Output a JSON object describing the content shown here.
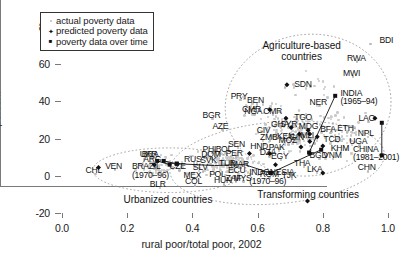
{
  "chart_data": {
    "type": "scatter",
    "title": "",
    "xlabel": "rural poor/total poor, 2002",
    "ylabel": "percent",
    "xlim": [
      0.0,
      1.0
    ],
    "ylim": [
      -20,
      80
    ],
    "xticks": [
      "0.0",
      "0.2",
      "0.4",
      "0.6",
      "0.8",
      "1.0"
    ],
    "yticks": [
      "-20",
      "0",
      "20",
      "40",
      "60",
      "80"
    ],
    "grid": false,
    "legend_position": "top-left",
    "legend": [
      {
        "marker": "dot",
        "label": "actual poverty data"
      },
      {
        "marker": "diamond",
        "label": "predicted poverty data"
      },
      {
        "marker": "square",
        "label": "poverty data over time"
      }
    ],
    "group_annotations": [
      {
        "label": "Agriculture-based",
        "label2": "countries",
        "x": 0.735,
        "y": 70
      },
      {
        "label": "Transforming countries",
        "x": 0.755,
        "y": -10.5
      },
      {
        "label": "Urbanized countries",
        "x": 0.325,
        "y": -13.0
      }
    ],
    "predicted_points": [
      {
        "code": "SDN",
        "x": 0.69,
        "y": 49.0,
        "label_dx": 5,
        "label_dy": -4
      },
      {
        "code": "CMR",
        "x": 0.637,
        "y": 35.5,
        "label_dx": -26,
        "label_dy": -4
      },
      {
        "code": "TGO",
        "x": 0.687,
        "y": 31.0,
        "label_dx": 5,
        "label_dy": -4
      },
      {
        "code": "SYR",
        "x": 0.703,
        "y": 26.0,
        "label_dx": -4,
        "label_dy": -12
      },
      {
        "code": "GIN",
        "x": 0.728,
        "y": 22.5,
        "label_dx": -5,
        "label_dy": -10
      },
      {
        "code": "MDG",
        "x": 0.755,
        "y": 24.5,
        "label_dx": -5,
        "label_dy": -11
      },
      {
        "code": "MLI",
        "x": 0.76,
        "y": 22.5,
        "label_dx": -4,
        "label_dy": -10
      },
      {
        "code": "TCD",
        "x": 0.783,
        "y": 21.0,
        "label_dx": 3,
        "label_dy": -4
      },
      {
        "code": "IRN",
        "x": 0.76,
        "y": 18.5,
        "label_dx": -4,
        "label_dy": -10
      },
      {
        "code": "YEM",
        "x": 0.8,
        "y": 16.0,
        "label_dx": 4,
        "label_dy": -4
      },
      {
        "code": "GTM",
        "x": 0.733,
        "y": 15.5,
        "label_dx": -6,
        "label_dy": -10
      },
      {
        "code": "IND",
        "x": 0.76,
        "y": 12.0,
        "label_dx": -4,
        "label_dy": -9
      },
      {
        "code": "IDN",
        "x": 0.637,
        "y": 12.0,
        "label_dx": -5,
        "label_dy": -9
      },
      {
        "code": "AGO",
        "x": 0.575,
        "y": 12.0,
        "label_dx": -23,
        "label_dy": -3
      },
      {
        "code": "TUN",
        "x": 0.655,
        "y": 6.0,
        "label_dx": -23,
        "label_dy": -3
      },
      {
        "code": "ZAR",
        "x": 0.8,
        "y": 1.5,
        "label_dx": 4,
        "label_dy": -4
      },
      {
        "code": "ZWE",
        "x": 0.753,
        "y": -13.5,
        "label_dx": 4,
        "label_dy": -4
      },
      {
        "code": "BRAZIL",
        "x": 0.283,
        "y": 6.0,
        "label_dx": 0,
        "label_dy": 0
      },
      {
        "code": "PNG",
        "x": 0.96,
        "y": 31.0,
        "label_dx": -22,
        "label_dy": -10
      },
      {
        "code": "CHL",
        "x": 0.112,
        "y": 4.5,
        "label_dx": -20,
        "label_dy": -2
      }
    ],
    "time_series": [
      {
        "name": "INDIA (1965-94)",
        "label": "INDIA",
        "label2": "(1965–94)",
        "points": [
          [
            0.838,
            43.0
          ],
          [
            0.758,
            12.5
          ]
        ]
      },
      {
        "name": "CHINA (1981-2001)",
        "label": "CHINA",
        "label2": "(1981–2001)",
        "points": [
          [
            0.981,
            28.5
          ],
          [
            0.981,
            11.0
          ]
        ]
      },
      {
        "name": "INDONESIA (1970-96)",
        "label": "INDONESIA",
        "label2": "(1970–96)",
        "points": [
          [
            0.795,
            14.0
          ],
          [
            0.64,
            1.5
          ]
        ]
      },
      {
        "name": "BRAZIL (1970-96)",
        "label": "BRAZIL",
        "label2": "(1970–96)",
        "points": [
          [
            0.292,
            8.0
          ],
          [
            0.33,
            6.0
          ]
        ]
      },
      {
        "name": "UKR",
        "label": "UKR",
        "label2": "",
        "points": [
          [
            0.312,
            8.0
          ],
          [
            0.352,
            6.5
          ]
        ]
      },
      {
        "name": "row-transform",
        "label": "",
        "label2": "",
        "points": [
          [
            0.352,
            6.5
          ],
          [
            0.468,
            5.5
          ],
          [
            0.56,
            6.0
          ],
          [
            0.64,
            1.5
          ]
        ]
      }
    ],
    "country_labels": [
      {
        "code": "BDI",
        "x": 0.962,
        "y": 72.5,
        "anchor": "left"
      },
      {
        "code": "RWA",
        "x": 0.905,
        "y": 63.0,
        "anchor": "center"
      },
      {
        "code": "MWI",
        "x": 0.893,
        "y": 55.0,
        "anchor": "center"
      },
      {
        "code": "SDN",
        "x": 0.7,
        "y": 49.0,
        "anchor": "left"
      },
      {
        "code": "CMR",
        "x": 0.62,
        "y": 35.5,
        "anchor": "right"
      },
      {
        "code": "PRY",
        "x": 0.548,
        "y": 42.5,
        "anchor": "center"
      },
      {
        "code": "BEN",
        "x": 0.598,
        "y": 40.0,
        "anchor": "center"
      },
      {
        "code": "NGA",
        "x": 0.59,
        "y": 34.5,
        "anchor": "center"
      },
      {
        "code": "CMR2",
        "x": 0.648,
        "y": 34.5,
        "anchor": "center"
      },
      {
        "code": "BGR",
        "x": 0.462,
        "y": 32.0,
        "anchor": "center"
      },
      {
        "code": "AZE",
        "x": 0.492,
        "y": 26.5,
        "anchor": "center"
      },
      {
        "code": "TGO",
        "x": 0.7,
        "y": 31.0,
        "anchor": "left"
      },
      {
        "code": "GHA",
        "x": 0.672,
        "y": 27.5,
        "anchor": "center"
      },
      {
        "code": "CIV",
        "x": 0.628,
        "y": 24.0,
        "anchor": "center"
      },
      {
        "code": "SYR",
        "x": 0.7,
        "y": 27.5,
        "anchor": "center"
      },
      {
        "code": "MDG",
        "x": 0.757,
        "y": 26.0,
        "anchor": "center"
      },
      {
        "code": "ZMB",
        "x": 0.638,
        "y": 20.5,
        "anchor": "center"
      },
      {
        "code": "KEN",
        "x": 0.69,
        "y": 21.0,
        "anchor": "center"
      },
      {
        "code": "MOZ",
        "x": 0.695,
        "y": 18.5,
        "anchor": "center"
      },
      {
        "code": "GIN",
        "x": 0.728,
        "y": 20.5,
        "anchor": "center"
      },
      {
        "code": "MLI",
        "x": 0.762,
        "y": 21.5,
        "anchor": "center"
      },
      {
        "code": "TCD",
        "x": 0.79,
        "y": 19.0,
        "anchor": "left"
      },
      {
        "code": "BFA",
        "x": 0.823,
        "y": 24.5,
        "anchor": "center"
      },
      {
        "code": "ETH",
        "x": 0.875,
        "y": 25.0,
        "anchor": "center"
      },
      {
        "code": "NPL",
        "x": 0.938,
        "y": 22.5,
        "anchor": "center"
      },
      {
        "code": "LAO",
        "x": 0.94,
        "y": 30.5,
        "anchor": "center"
      },
      {
        "code": "UGA",
        "x": 0.912,
        "y": 18.0,
        "anchor": "center"
      },
      {
        "code": "KHM",
        "x": 0.855,
        "y": 14.5,
        "anchor": "center"
      },
      {
        "code": "VNM",
        "x": 0.832,
        "y": 10.5,
        "anchor": "center"
      },
      {
        "code": "BGD",
        "x": 0.79,
        "y": 10.5,
        "anchor": "center"
      },
      {
        "code": "LKA",
        "x": 0.782,
        "y": 3.0,
        "anchor": "center"
      },
      {
        "code": "CHN",
        "x": 0.938,
        "y": 4.0,
        "anchor": "center"
      },
      {
        "code": "THA",
        "x": 0.742,
        "y": 6.5,
        "anchor": "center"
      },
      {
        "code": "HND",
        "x": 0.608,
        "y": 15.5,
        "anchor": "center"
      },
      {
        "code": "PAK",
        "x": 0.665,
        "y": 15.0,
        "anchor": "center"
      },
      {
        "code": "DZA",
        "x": 0.637,
        "y": 12.0,
        "anchor": "center"
      },
      {
        "code": "EGY",
        "x": 0.672,
        "y": 10.0,
        "anchor": "center"
      },
      {
        "code": "SEN",
        "x": 0.54,
        "y": 16.5,
        "anchor": "center"
      },
      {
        "code": "BOL",
        "x": 0.502,
        "y": 14.0,
        "anchor": "center"
      },
      {
        "code": "PHL",
        "x": 0.462,
        "y": 14.0,
        "anchor": "center"
      },
      {
        "code": "DOM",
        "x": 0.458,
        "y": 11.0,
        "anchor": "center"
      },
      {
        "code": "SVK",
        "x": 0.455,
        "y": 8.0,
        "anchor": "center"
      },
      {
        "code": "PER",
        "x": 0.533,
        "y": 11.5,
        "anchor": "center"
      },
      {
        "code": "TUR",
        "x": 0.512,
        "y": 6.5,
        "anchor": "center"
      },
      {
        "code": "MAR",
        "x": 0.548,
        "y": 6.0,
        "anchor": "center"
      },
      {
        "code": "RUS",
        "x": 0.405,
        "y": 8.5,
        "anchor": "center"
      },
      {
        "code": "CZE",
        "x": 0.36,
        "y": 4.5,
        "anchor": "center"
      },
      {
        "code": "SLV",
        "x": 0.432,
        "y": 4.0,
        "anchor": "center"
      },
      {
        "code": "ECU",
        "x": 0.54,
        "y": 2.5,
        "anchor": "center"
      },
      {
        "code": "MEX",
        "x": 0.403,
        "y": 0.0,
        "anchor": "center"
      },
      {
        "code": "COL",
        "x": 0.408,
        "y": -3.5,
        "anchor": "center"
      },
      {
        "code": "POL",
        "x": 0.482,
        "y": 0.5,
        "anchor": "center"
      },
      {
        "code": "HUN",
        "x": 0.497,
        "y": -3.0,
        "anchor": "center"
      },
      {
        "code": "ZAF",
        "x": 0.533,
        "y": -1.5,
        "anchor": "center"
      },
      {
        "code": "MYS",
        "x": 0.557,
        "y": -1.5,
        "anchor": "center"
      },
      {
        "code": "ROM",
        "x": 0.637,
        "y": 0.5,
        "anchor": "center"
      },
      {
        "code": "BLR",
        "x": 0.3,
        "y": -5.0,
        "anchor": "center"
      },
      {
        "code": "BRA",
        "x": 0.275,
        "y": 11.0,
        "anchor": "center"
      },
      {
        "code": "ARG",
        "x": 0.28,
        "y": 8.5,
        "anchor": "center"
      },
      {
        "code": "VEN",
        "x": 0.163,
        "y": 5.0,
        "anchor": "center"
      },
      {
        "code": "CHL",
        "x": 0.103,
        "y": 2.5,
        "anchor": "center"
      },
      {
        "code": "NER",
        "x": 0.79,
        "y": 39.0,
        "anchor": "center"
      },
      {
        "code": "TJK",
        "x": 0.705,
        "y": 0.0,
        "anchor": "center"
      }
    ],
    "cloud_point_count": 470
  }
}
